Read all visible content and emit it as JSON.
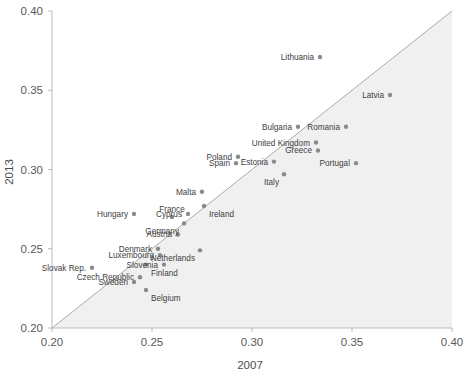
{
  "chart_data": {
    "type": "scatter",
    "title": "",
    "xlabel": "2007",
    "ylabel": "2013",
    "xlim": [
      0.2,
      0.4
    ],
    "ylim": [
      0.2,
      0.4
    ],
    "xticks": [
      "0.20",
      "0.25",
      "0.30",
      "0.35",
      "0.40"
    ],
    "yticks": [
      "0.20",
      "0.25",
      "0.30",
      "0.35",
      "0.40"
    ],
    "xtick_values": [
      0.2,
      0.25,
      0.3,
      0.35,
      0.4
    ],
    "ytick_values": [
      0.2,
      0.25,
      0.3,
      0.35,
      0.4
    ],
    "grid": false,
    "legend": "none",
    "annotations": [
      "Diagonal 45-degree reference line from (0.20,0.20) to (0.40,0.40)",
      "Shaded light-gray region below the diagonal line"
    ],
    "series": [
      {
        "name": "EU countries",
        "point_labels": [
          "Lithuania",
          "Latvia",
          "Bulgaria",
          "Romania",
          "United Kingdom",
          "Greece",
          "Poland",
          "Estonia",
          "Italy",
          "Portugal",
          "Spain",
          "Malta",
          "Ireland",
          "Hungary",
          "France",
          "Cyprus",
          "Germany",
          "Austria",
          "Denmark",
          "Luxembourg",
          "Netherlands",
          "Slovenia",
          "Finland",
          "Slovak Rep.",
          "Czech Republic",
          "Sweden",
          "Belgium"
        ],
        "points": [
          {
            "label": "Lithuania",
            "x": 0.334,
            "y": 0.371,
            "label_pos": "left"
          },
          {
            "label": "Latvia",
            "x": 0.369,
            "y": 0.347,
            "label_pos": "left"
          },
          {
            "label": "Bulgaria",
            "x": 0.323,
            "y": 0.327,
            "label_pos": "left"
          },
          {
            "label": "Romania",
            "x": 0.347,
            "y": 0.327,
            "label_pos": "left"
          },
          {
            "label": "United Kingdom",
            "x": 0.332,
            "y": 0.317,
            "label_pos": "left"
          },
          {
            "label": "Greece",
            "x": 0.333,
            "y": 0.312,
            "label_pos": "left"
          },
          {
            "label": "Poland",
            "x": 0.293,
            "y": 0.308,
            "label_pos": "left"
          },
          {
            "label": "Estonia",
            "x": 0.311,
            "y": 0.305,
            "label_pos": "left-inline"
          },
          {
            "label": "Italy",
            "x": 0.316,
            "y": 0.297,
            "label_pos": "left-below"
          },
          {
            "label": "Portugal",
            "x": 0.352,
            "y": 0.304,
            "label_pos": "left"
          },
          {
            "label": "Spain",
            "x": 0.292,
            "y": 0.304,
            "label_pos": "left"
          },
          {
            "label": "Malta",
            "x": 0.275,
            "y": 0.286,
            "label_pos": "left"
          },
          {
            "label": "Ireland",
            "x": 0.276,
            "y": 0.277,
            "label_pos": "right-below"
          },
          {
            "label": "Hungary",
            "x": 0.241,
            "y": 0.272,
            "label_pos": "left"
          },
          {
            "label": "France",
            "x": 0.26,
            "y": 0.27,
            "label_pos": "above"
          },
          {
            "label": "Cyprus",
            "x": 0.268,
            "y": 0.272,
            "label_pos": "left"
          },
          {
            "label": "Germany",
            "x": 0.266,
            "y": 0.266,
            "label_pos": "left-below"
          },
          {
            "label": "Austria",
            "x": 0.263,
            "y": 0.259,
            "label_pos": "left"
          },
          {
            "label": "Denmark",
            "x": 0.253,
            "y": 0.25,
            "label_pos": "left"
          },
          {
            "label": "Luxembourg",
            "x": 0.254,
            "y": 0.246,
            "label_pos": "left-inline"
          },
          {
            "label": "Netherlands",
            "x": 0.274,
            "y": 0.249,
            "label_pos": "left-below"
          },
          {
            "label": "Slovenia",
            "x": 0.256,
            "y": 0.24,
            "label_pos": "left"
          },
          {
            "label": "Finland",
            "x": 0.247,
            "y": 0.24,
            "label_pos": "right-below"
          },
          {
            "label": "Slovak Rep.",
            "x": 0.22,
            "y": 0.238,
            "label_pos": "left"
          },
          {
            "label": "Czech Republic",
            "x": 0.244,
            "y": 0.232,
            "label_pos": "left"
          },
          {
            "label": "Sweden",
            "x": 0.241,
            "y": 0.229,
            "label_pos": "left"
          },
          {
            "label": "Belgium",
            "x": 0.247,
            "y": 0.224,
            "label_pos": "right-below"
          }
        ]
      }
    ],
    "colors": {
      "marker": "#8a8a8a",
      "diagonal_line": "#a0a0a0",
      "shaded_region": "#f0f0f0",
      "axis": "#b3b3b3",
      "text": "#4d4d4d"
    }
  }
}
